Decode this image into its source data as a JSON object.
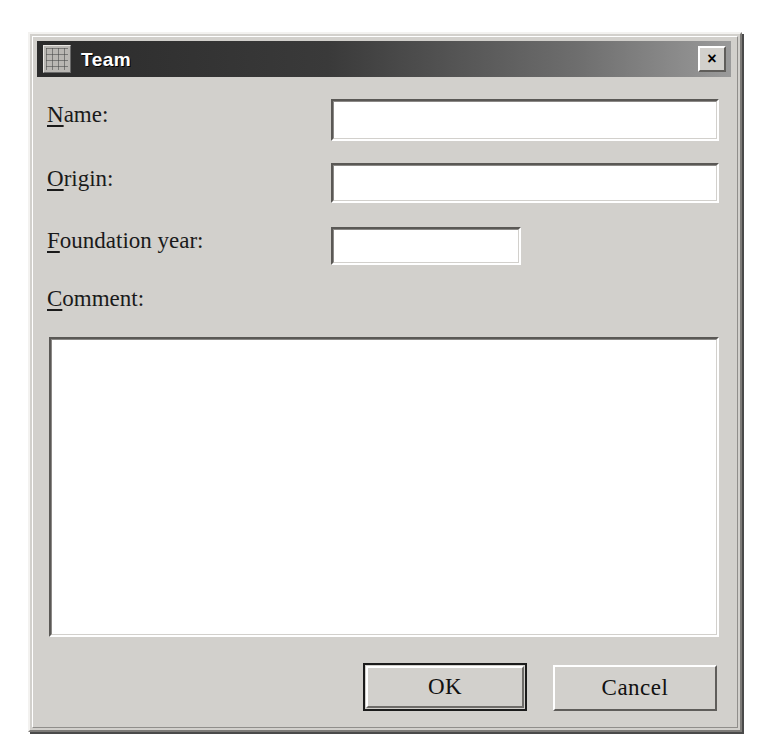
{
  "window": {
    "title": "Team",
    "icon": "window-app-icon",
    "close_label": "×",
    "close_icon": "close-icon"
  },
  "form": {
    "fields": [
      {
        "id": "name",
        "label_accelerator": "N",
        "label_rest": "ame:",
        "value": "",
        "placeholder": ""
      },
      {
        "id": "origin",
        "label_accelerator": "O",
        "label_rest": "rigin:",
        "value": "",
        "placeholder": ""
      },
      {
        "id": "foundation_year",
        "label_accelerator": "F",
        "label_rest": "oundation year:",
        "value": "",
        "placeholder": ""
      },
      {
        "id": "comment",
        "label_accelerator": "C",
        "label_rest": "omment:",
        "value": "",
        "placeholder": ""
      }
    ]
  },
  "buttons": {
    "ok": "OK",
    "cancel": "Cancel"
  },
  "colors": {
    "dialog_face": "#d2d0cc",
    "titlebar_dark": "#2b2b2b",
    "titlebar_light": "#9a9a9a",
    "field_background": "#ffffff",
    "text": "#1a1a1a"
  }
}
